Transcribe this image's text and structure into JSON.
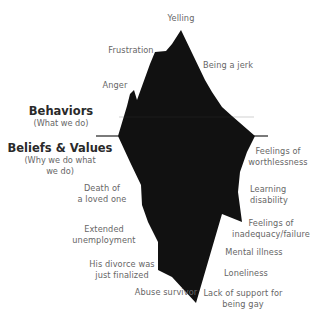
{
  "diagram": {
    "type": "iceberg",
    "colors": {
      "iceberg": "#111111",
      "waterline": "#222222",
      "text": "#666666",
      "heading": "#2a2a2a"
    },
    "above_water": {
      "heading": "Behaviors",
      "subheading": "(What we do)",
      "items": [
        "Yelling",
        "Frustration",
        "Being a jerk",
        "Anger"
      ]
    },
    "below_water": {
      "heading": "Beliefs & Values",
      "subheading_line1": "(Why we do what",
      "subheading_line2": "we do)",
      "left_items": [
        {
          "line1": "Death of",
          "line2": "a loved one"
        },
        {
          "line1": "Extended",
          "line2": "unemployment"
        },
        {
          "line1": "His divorce was",
          "line2": "just finalized"
        },
        {
          "line1": "Abuse survivor"
        }
      ],
      "right_items": [
        {
          "line1": "Feelings of",
          "line2": "worthlessness"
        },
        {
          "line1": "Learning",
          "line2": "disability"
        },
        {
          "line1": "Feelings of",
          "line2": "inadequacy/failure"
        },
        {
          "line1": "Mental illness"
        },
        {
          "line1": "Loneliness"
        },
        {
          "line1": "Lack of support for",
          "line2": "being gay"
        }
      ]
    }
  }
}
